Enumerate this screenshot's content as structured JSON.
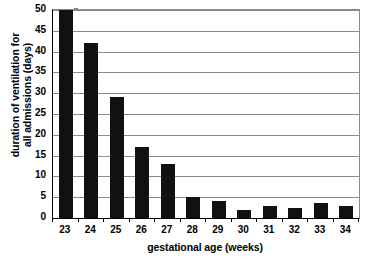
{
  "chart_data": {
    "type": "bar",
    "title": "",
    "subtitle": "",
    "xlabel": "gestational age (weeks)",
    "ylabel_line1": "duration of ventilation for",
    "ylabel_line2": "all admissions (days)",
    "ylabel": "duration of ventilation for all admissions (days)",
    "categories": [
      "23",
      "24",
      "25",
      "26",
      "27",
      "28",
      "29",
      "30",
      "31",
      "32",
      "33",
      "34"
    ],
    "values": [
      50,
      42,
      29,
      17,
      13,
      5,
      4,
      2,
      3,
      2.5,
      3.5,
      3
    ],
    "ylim": [
      0,
      50
    ],
    "ytick_labels": [
      "0",
      "5",
      "10",
      "15",
      "20",
      "25",
      "30",
      "35",
      "40",
      "45",
      "50"
    ],
    "ytick_values": [
      0,
      5,
      10,
      15,
      20,
      25,
      30,
      35,
      40,
      45,
      50
    ],
    "grid": true,
    "grid_axis": "y",
    "legend": "none",
    "bar_color": "#111111",
    "grid_color": "#8a8a8a",
    "axis_color": "#000000",
    "background_color": "#ffffff"
  }
}
